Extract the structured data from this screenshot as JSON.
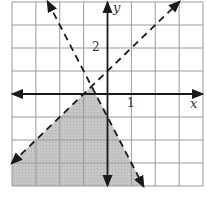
{
  "graph": {
    "x_range": [
      -4,
      4
    ],
    "y_range": [
      -4,
      4
    ],
    "grid_step": 1,
    "axis_labels": {
      "x": "x",
      "y": "y"
    },
    "tick_labels": {
      "x_1": "1",
      "y_2": "2"
    },
    "colors": {
      "grid": "#9a9a9a",
      "axis": "#1a1a1a",
      "line": "#1a1a1a",
      "shade": "#c4c4c4"
    },
    "boundary_lines": [
      {
        "equation": "y = x + 1",
        "style": "dashed",
        "slope": 1,
        "intercept": 1
      },
      {
        "equation": "y = -2x - 1",
        "style": "dashed",
        "slope": -2,
        "intercept": -1
      }
    ],
    "shaded_region": "below both lines (y < x + 1 and y < -2x - 1)",
    "intersection": [
      -0.667,
      0.333
    ]
  }
}
